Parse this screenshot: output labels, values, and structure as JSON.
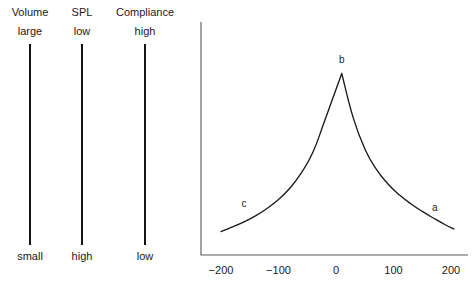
{
  "scales": [
    {
      "name": "volume",
      "title": "Volume",
      "top_label": "large",
      "bottom_label": "small",
      "center_x": 30
    },
    {
      "name": "spl",
      "title": "SPL",
      "top_label": "low",
      "bottom_label": "high",
      "center_x": 82
    },
    {
      "name": "compliance",
      "title": "Compliance",
      "top_label": "high",
      "bottom_label": "low",
      "center_x": 145
    }
  ],
  "chart_data": {
    "type": "line",
    "title": "",
    "xlabel": "",
    "ylabel": "",
    "grid": false,
    "legend": "none",
    "axis_color": "#5a5a5a",
    "curve_color": "#1a1a1a",
    "xlim": [
      -240,
      230
    ],
    "ylim": [
      0,
      1
    ],
    "xticks": [
      -200,
      -100,
      0,
      100,
      200
    ],
    "xtick_labels": [
      "−200",
      "−100",
      "0",
      "100",
      "200"
    ],
    "series": [
      {
        "name": "tympanogram",
        "x": [
          -200,
          -180,
          -160,
          -140,
          -120,
          -100,
          -80,
          -60,
          -40,
          -20,
          10,
          30,
          50,
          70,
          90,
          110,
          130,
          150,
          170,
          190,
          205
        ],
        "y": [
          0.055,
          0.082,
          0.112,
          0.147,
          0.19,
          0.243,
          0.31,
          0.4,
          0.52,
          0.7,
          0.98,
          0.72,
          0.54,
          0.42,
          0.335,
          0.27,
          0.218,
          0.173,
          0.133,
          0.095,
          0.07
        ]
      }
    ],
    "annotations": [
      {
        "name": "point-a",
        "label": "a",
        "x": 172,
        "y": 0.195
      },
      {
        "name": "point-b",
        "label": "b",
        "x": 10,
        "y": 1.06
      },
      {
        "name": "point-c",
        "label": "c",
        "x": -160,
        "y": 0.215
      }
    ]
  }
}
